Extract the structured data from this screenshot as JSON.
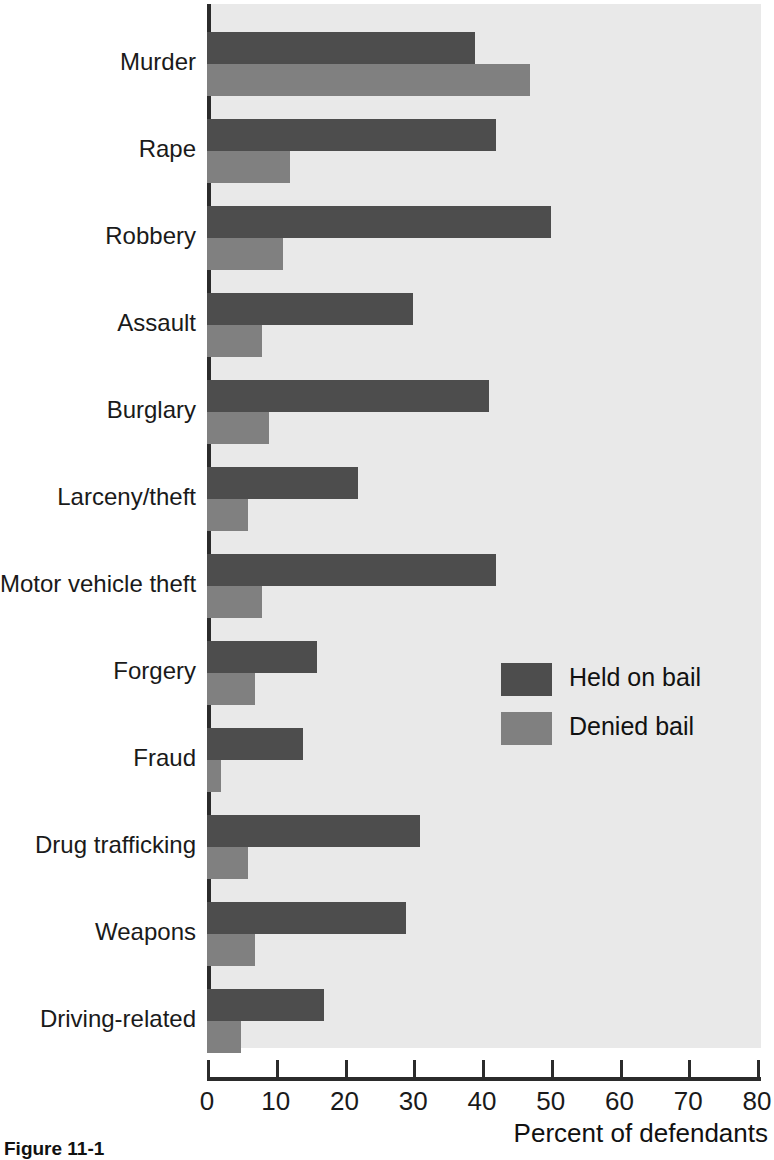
{
  "figure": {
    "caption": "Figure 11-1",
    "x_axis_title": "Percent of defendants"
  },
  "legend": {
    "position": "inside-right",
    "entries": [
      {
        "label": "Held on bail",
        "color": "#4d4d4d",
        "swatch": "legend-swatch-held"
      },
      {
        "label": "Denied bail",
        "color": "#808080",
        "swatch": "legend-swatch-denied"
      }
    ]
  },
  "colors": {
    "held_on_bail": "#4d4d4d",
    "denied_bail": "#808080",
    "plot_background": "#e9e9e9",
    "axis": "#2b2b2b",
    "text": "#1a1a1a",
    "page_background": "#ffffff"
  },
  "chart_data": {
    "type": "bar",
    "orientation": "horizontal",
    "title": "",
    "subtitle": "",
    "xlabel": "Percent of defendants",
    "ylabel": "",
    "xlim": [
      0,
      80
    ],
    "ylim": null,
    "grid": false,
    "xticks": [
      0,
      10,
      20,
      30,
      40,
      50,
      60,
      70,
      80
    ],
    "xtick_labels": [
      "0",
      "10",
      "20",
      "30",
      "40",
      "50",
      "60",
      "70",
      "80"
    ],
    "categories": [
      "Murder",
      "Rape",
      "Robbery",
      "Assault",
      "Burglary",
      "Larceny/theft",
      "Motor vehicle theft",
      "Forgery",
      "Fraud",
      "Drug trafficking",
      "Weapons",
      "Driving-related"
    ],
    "series": [
      {
        "name": "Held on bail",
        "color": "#4d4d4d",
        "values": [
          39,
          42,
          50,
          30,
          41,
          22,
          42,
          16,
          14,
          31,
          29,
          17
        ]
      },
      {
        "name": "Denied bail",
        "color": "#808080",
        "values": [
          47,
          12,
          11,
          8,
          9,
          6,
          8,
          7,
          2,
          6,
          7,
          5
        ]
      }
    ],
    "legend_position": "inside-right",
    "annotations": []
  }
}
